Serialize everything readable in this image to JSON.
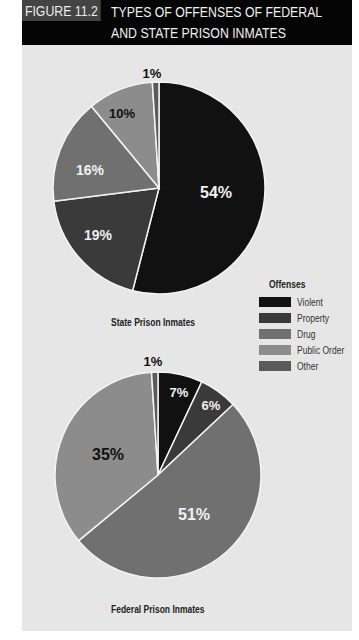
{
  "header": {
    "figure_label": "FIGURE 11.2",
    "title_line1": "TYPES OF OFFENSES OF FEDERAL",
    "title_line2": "AND STATE PRISON INMATES"
  },
  "legend": {
    "title": "Offenses",
    "items": [
      {
        "label": "Violent",
        "color": "#111111"
      },
      {
        "label": "Property",
        "color": "#3a3a3a"
      },
      {
        "label": "Drug",
        "color": "#707070"
      },
      {
        "label": "Public Order",
        "color": "#8c8c8c"
      },
      {
        "label": "Other",
        "color": "#5a5a5a"
      }
    ]
  },
  "captions": {
    "state": "State Prison Inmates",
    "federal": "Federal Prison Inmates"
  },
  "chart_data": [
    {
      "type": "pie",
      "title": "State Prison Inmates",
      "categories": [
        "Violent",
        "Property",
        "Drug",
        "Public Order",
        "Other"
      ],
      "values": [
        54,
        19,
        16,
        10,
        1
      ],
      "labels": [
        "54%",
        "19%",
        "16%",
        "10%",
        "1%"
      ]
    },
    {
      "type": "pie",
      "title": "Federal Prison Inmates",
      "categories": [
        "Violent",
        "Property",
        "Drug",
        "Public Order",
        "Other"
      ],
      "values": [
        7,
        6,
        51,
        35,
        1
      ],
      "labels": [
        "7%",
        "6%",
        "51%",
        "35%",
        "1%"
      ]
    }
  ]
}
